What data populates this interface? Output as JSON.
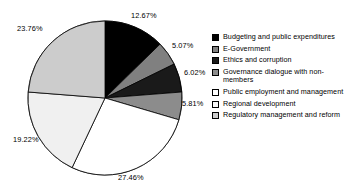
{
  "chart_data": {
    "type": "pie",
    "title": "",
    "xlabel": "",
    "ylabel": "",
    "grid": false,
    "legend_position": "right",
    "start_angle_deg": 0,
    "direction": "clockwise",
    "units": "percent",
    "categories": [
      "Budgeting and public expenditures",
      "E-Government",
      "Ethics and corruption",
      "Governance dialogue with non-members",
      "Public employment and management",
      "Regional development",
      "Regulatory management and reform"
    ],
    "values": [
      12.67,
      5.07,
      6.02,
      5.81,
      27.46,
      19.22,
      23.76
    ],
    "data_labels": [
      "12.67%",
      "5.07%",
      "6.02%",
      "5.81%",
      "27.46%",
      "19.22%",
      "23.76%"
    ],
    "colors": [
      "#000000",
      "#808080",
      "#1a1a1a",
      "#8c8c8c",
      "#ffffff",
      "#f0f0f0",
      "#cccccc"
    ],
    "stroke_color": "#000000",
    "slices": [
      {
        "label": "Budgeting and public expenditures",
        "value": 12.67,
        "data_label": "12.67%",
        "color": "#000000"
      },
      {
        "label": "E-Government",
        "value": 5.07,
        "data_label": "5.07%",
        "color": "#808080"
      },
      {
        "label": "Ethics and corruption",
        "value": 6.02,
        "data_label": "6.02%",
        "color": "#1a1a1a"
      },
      {
        "label": "Governance dialogue with non-members",
        "value": 5.81,
        "data_label": "5.81%",
        "color": "#8c8c8c"
      },
      {
        "label": "Public employment and management",
        "value": 27.46,
        "data_label": "27.46%",
        "color": "#ffffff"
      },
      {
        "label": "Regional development",
        "value": 19.22,
        "data_label": "19.22%",
        "color": "#f0f0f0"
      },
      {
        "label": "Regulatory management and reform",
        "value": 23.76,
        "data_label": "23.76%",
        "color": "#cccccc"
      }
    ]
  },
  "legend": {
    "items": [
      {
        "label": "Budgeting and public expenditures",
        "color": "#000000"
      },
      {
        "label": "E-Government",
        "color": "#808080"
      },
      {
        "label": "Ethics and corruption",
        "color": "#1a1a1a"
      },
      {
        "label": "Governance dialogue with non-members",
        "color": "#8c8c8c"
      },
      {
        "label": "Public employment and management",
        "color": "#ffffff"
      },
      {
        "label": "Regional development",
        "color": "#f8f8f8"
      },
      {
        "label": "Regulatory management and reform",
        "color": "#cccccc"
      }
    ]
  }
}
